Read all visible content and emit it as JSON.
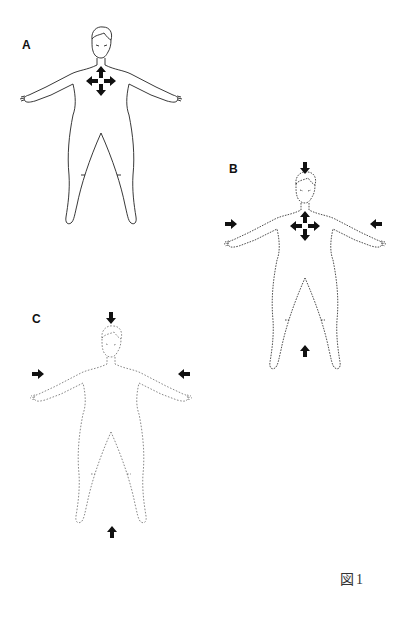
{
  "figure": {
    "caption": "図1",
    "panels": [
      {
        "id": "A",
        "label": "A",
        "outline_style": "solid",
        "internal_arrows": [
          "up",
          "down",
          "left",
          "right"
        ],
        "external_arrows": []
      },
      {
        "id": "B",
        "label": "B",
        "outline_style": "dashed",
        "internal_arrows": [
          "up",
          "down",
          "left",
          "right"
        ],
        "external_arrows": [
          "top-pointing-down",
          "left-pointing-right",
          "right-pointing-left",
          "bottom-pointing-up"
        ]
      },
      {
        "id": "C",
        "label": "C",
        "outline_style": "faint-dashed",
        "internal_arrows": [],
        "external_arrows": [
          "top-pointing-down",
          "left-pointing-right",
          "right-pointing-left",
          "bottom-pointing-up"
        ]
      }
    ],
    "colors": {
      "line": "#222222",
      "arrow": "#111111",
      "faint_line": "#555555",
      "background": "#ffffff"
    }
  }
}
